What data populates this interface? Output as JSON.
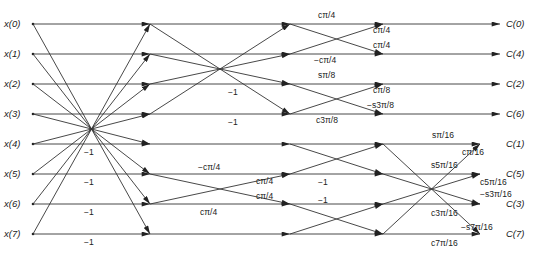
{
  "diagram": {
    "inputs": [
      "x(0)",
      "x(1)",
      "x(2)",
      "x(3)",
      "x(4)",
      "x(5)",
      "x(6)",
      "x(7)"
    ],
    "outputs": [
      "C(0)",
      "C(4)",
      "C(2)",
      "C(6)",
      "C(1)",
      "C(5)",
      "C(3)",
      "C(7)"
    ],
    "stage1": {
      "labels": [
        "−1",
        "−1",
        "−1",
        "−1"
      ]
    },
    "stage2": {
      "labels": [
        "−1",
        "−1",
        "−cπ/4",
        "cπ/4",
        "cπ/4",
        "cπ/4"
      ]
    },
    "stage3": {
      "labels": [
        "cπ/4",
        "cπ/4",
        "cπ/4",
        "−cπ/4",
        "sπ/8",
        "cπ/8",
        "−s3π/8",
        "c3π/8",
        "−1",
        "−1"
      ]
    },
    "stage4": {
      "labels": [
        "sπ/16",
        "cπ/16",
        "s5π/16",
        "c5π/16",
        "−s3π/16",
        "c3π/16",
        "−s7π/16",
        "c7π/16"
      ]
    },
    "colors": {
      "line": "#333333",
      "text": "#222222",
      "background": "#ffffff"
    }
  }
}
